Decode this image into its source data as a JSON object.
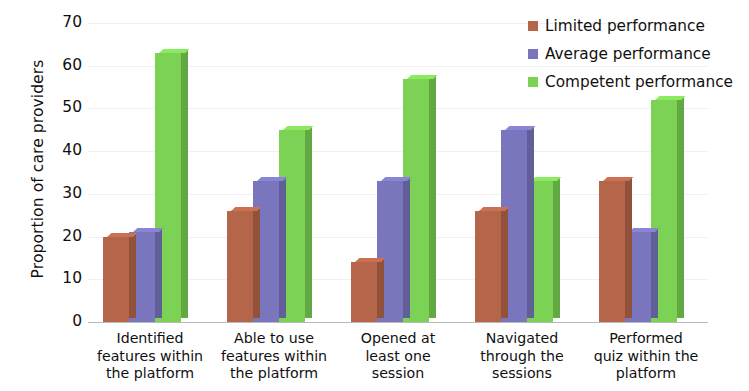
{
  "chart_data": {
    "type": "bar",
    "title": "",
    "subtitle": "",
    "xlabel": "",
    "ylabel": "Proportion of care providers",
    "ylim": [
      0,
      70
    ],
    "yticks": [
      0,
      10,
      20,
      30,
      40,
      50,
      60,
      70
    ],
    "ytick_labels": [
      "0",
      "10",
      "20",
      "30",
      "40",
      "50",
      "60",
      "70"
    ],
    "grid": true,
    "legend_position": "top-right",
    "style": "3d-clustered-column",
    "categories": [
      "Identified features within the platform",
      "Able to use features within the platform",
      "Opened at least one session",
      "Navigated through the sessions",
      "Performed quiz within the platform"
    ],
    "category_lines": [
      [
        "Identified",
        "features within",
        "the platform"
      ],
      [
        "Able to use",
        "features within",
        "the platform"
      ],
      [
        "Opened at",
        "least one",
        "session"
      ],
      [
        "Navigated",
        "through the",
        "sessions"
      ],
      [
        "Performed",
        "quiz within the",
        "platform"
      ]
    ],
    "series": [
      {
        "name": "Limited performance",
        "color": "#b5654a",
        "values": [
          20,
          26,
          14,
          26,
          33
        ]
      },
      {
        "name": "Average performance",
        "color": "#7a76bd",
        "values": [
          21,
          33,
          33,
          45,
          21
        ]
      },
      {
        "name": "Competent performance",
        "color": "#7bd254",
        "values": [
          63,
          45,
          57,
          33,
          52
        ]
      }
    ]
  },
  "legend": {
    "items": [
      {
        "label": "Limited performance",
        "color": "#b5654a"
      },
      {
        "label": "Average performance",
        "color": "#7a76bd"
      },
      {
        "label": "Competent performance",
        "color": "#7bd254"
      }
    ]
  }
}
